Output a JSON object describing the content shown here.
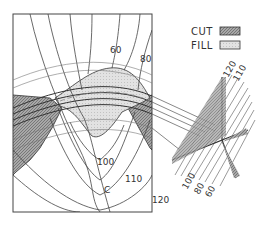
{
  "legend": {
    "cut": {
      "label": "CUT",
      "color": "#9a9a9a"
    },
    "fill": {
      "label": "FILL",
      "color": "#dedede"
    }
  },
  "contours": {
    "plan": [
      "60",
      "80",
      "100",
      "110",
      "120"
    ],
    "center_marker": "C"
  },
  "section": {
    "upper_labels": [
      "120",
      "110"
    ],
    "lower_labels": [
      "100",
      "80",
      "60"
    ]
  },
  "colors": {
    "line": "#333333",
    "cut": "#9a9a9a",
    "fill": "#dedede",
    "background": "#ffffff"
  }
}
